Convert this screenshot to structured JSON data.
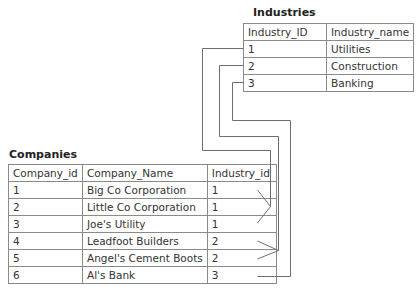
{
  "industries": {
    "title": "Industries",
    "headers": [
      "Industry_ID",
      "Industry_name"
    ],
    "rows": [
      [
        "1",
        "Utilities"
      ],
      [
        "2",
        "Construction"
      ],
      [
        "3",
        "Banking"
      ]
    ]
  },
  "companies": {
    "title": "Companies",
    "headers": [
      "Company_id",
      "Company_Name",
      "Industry_id"
    ],
    "rows": [
      [
        "1",
        "Big Co Corporation",
        "1"
      ],
      [
        "2",
        "Little Co Corporation",
        "1"
      ],
      [
        "3",
        "Joe's Utility",
        "1"
      ],
      [
        "4",
        "Leadfoot Builders",
        "2"
      ],
      [
        "5",
        "Angel's Cement Boots",
        "2"
      ],
      [
        "6",
        "Al's Bank",
        "3"
      ]
    ]
  },
  "relationships": [
    {
      "industry_id": "1",
      "company_rows": [
        1,
        2,
        3
      ],
      "type": "one-to-many"
    },
    {
      "industry_id": "2",
      "company_rows": [
        4,
        5
      ],
      "type": "one-to-many"
    },
    {
      "industry_id": "3",
      "company_rows": [
        6
      ],
      "type": "one-to-one"
    }
  ],
  "colors": {
    "line": "#6e6e6e",
    "border": "#8a8a8a"
  }
}
